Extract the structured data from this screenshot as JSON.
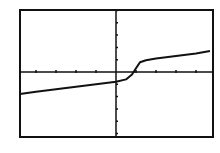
{
  "chart_data": {
    "type": "line",
    "title": "",
    "xlabel": "",
    "ylabel": "",
    "grid": false,
    "legend": null,
    "xlim": [
      -5,
      5
    ],
    "ylim": [
      -5,
      5
    ],
    "x_ticks": [
      -4,
      -3,
      -2,
      -1,
      1,
      2,
      3,
      4
    ],
    "y_ticks": [
      -5,
      -4,
      -3,
      -2,
      -1,
      1,
      2,
      3,
      4,
      5
    ],
    "series": [
      {
        "name": "f(x)",
        "x": [
          -4.8,
          -4.0,
          -3.0,
          -2.0,
          -1.0,
          0.0,
          0.5,
          0.8,
          1.0,
          1.2,
          1.5,
          2.0,
          3.0,
          4.0,
          4.7
        ],
        "y": [
          -1.8,
          -1.6,
          -1.4,
          -1.2,
          -1.0,
          -0.8,
          -0.6,
          -0.2,
          0.3,
          0.8,
          0.95,
          1.1,
          1.3,
          1.5,
          1.7
        ]
      }
    ],
    "frame": {
      "left": 20,
      "top": 10,
      "right": 213,
      "bottom": 137
    },
    "axis_origin_px": {
      "x": 116,
      "y": 72
    },
    "px_per_unit": {
      "x": 20,
      "y": 12.3
    }
  },
  "colors": {
    "line": "#111111",
    "background": "#ffffff"
  }
}
